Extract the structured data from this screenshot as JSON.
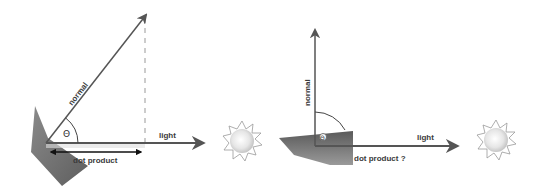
{
  "diagrams": [
    {
      "id": "angled",
      "labels": {
        "normal": "normal",
        "light": "light",
        "dot_product": "dot product",
        "angle": "Θ"
      }
    },
    {
      "id": "perpendicular",
      "labels": {
        "normal": "normal",
        "light": "light",
        "dot_product": "dot product ?",
        "angle": "Θ"
      }
    }
  ],
  "colors": {
    "vector": "#555555",
    "surface_dark": "#6a6a6a",
    "surface_light": "#b0b0b0",
    "dashed": "#999999",
    "sun": "#dcdcdc"
  }
}
